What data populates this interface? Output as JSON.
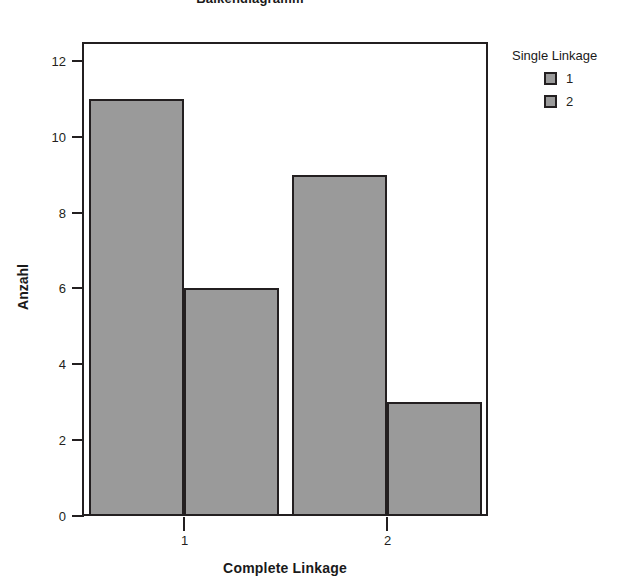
{
  "chart_data": {
    "type": "bar",
    "title": "Balkendiagramm",
    "xlabel": "Complete Linkage",
    "ylabel": "Anzahl",
    "categories": [
      "1",
      "2"
    ],
    "series": [
      {
        "name": "1",
        "values": [
          11,
          9
        ]
      },
      {
        "name": "2",
        "values": [
          6,
          3
        ]
      }
    ],
    "bars": [
      {
        "group": "1",
        "series": "1",
        "value": 11
      },
      {
        "group": "1",
        "series": "2",
        "value": 6
      },
      {
        "group": "2",
        "series": "1",
        "value": 9
      },
      {
        "group": "2",
        "series": "2",
        "value": 3
      }
    ],
    "ylim": [
      0,
      12.5
    ],
    "y_ticks": [
      "0",
      "2",
      "4",
      "6",
      "8",
      "10",
      "12"
    ],
    "y_tick_values": [
      0,
      2,
      4,
      6,
      8,
      10,
      12
    ],
    "x_ticks": [
      "1",
      "2"
    ],
    "grid": false,
    "legend_position": "right",
    "bar_fill_color": "#9a9a9a",
    "bar_border_color": "#231f20",
    "axis_color": "#231f20",
    "background_color": "#ffffff"
  },
  "legend": {
    "title": "Single Linkage",
    "entries": [
      {
        "label": "1",
        "color": "#9a9a9a"
      },
      {
        "label": "2",
        "color": "#9a9a9a"
      }
    ]
  },
  "axes": {
    "y_title": "Anzahl",
    "x_title": "Complete Linkage",
    "y_tick_labels": [
      "12",
      "10",
      "8",
      "6",
      "4",
      "2",
      "0"
    ],
    "x_tick_labels": [
      "1",
      "2"
    ]
  }
}
